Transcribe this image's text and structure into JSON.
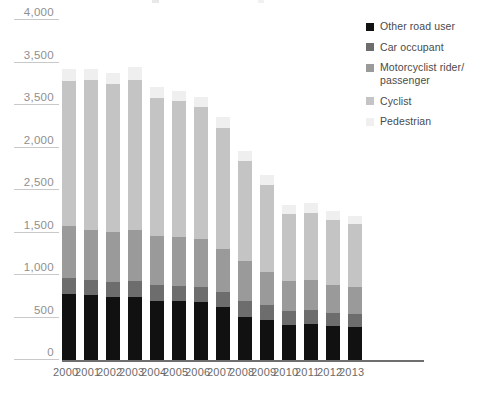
{
  "chart_data": {
    "type": "bar",
    "title": "",
    "xlabel": "",
    "ylabel": "",
    "stacked": true,
    "grid": true,
    "legend_position": "right",
    "ylim": [
      0,
      4000
    ],
    "categories": [
      "2000",
      "2001",
      "2002",
      "2003",
      "2004",
      "2005",
      "2006",
      "2007",
      "2008",
      "2009",
      "2010",
      "2011",
      "2012",
      "2013"
    ],
    "y_axis_ticks": [
      "4,000",
      "3,500",
      "3,500",
      "2,000",
      "2,500",
      "1,500",
      "1,000",
      "500",
      "0"
    ],
    "series": [
      {
        "name": "Other road user",
        "color": "#111111",
        "values": [
          780,
          760,
          740,
          745,
          700,
          690,
          680,
          620,
          510,
          470,
          415,
          425,
          400,
          390
        ]
      },
      {
        "name": "Car occupant",
        "color": "#6d6d6d",
        "values": [
          180,
          185,
          180,
          185,
          180,
          175,
          175,
          175,
          190,
          175,
          160,
          160,
          155,
          150
        ]
      },
      {
        "name": "Motorcyclist rider/ passenger",
        "color": "#9a9a9a",
        "values": [
          620,
          590,
          590,
          600,
          580,
          580,
          565,
          510,
          460,
          390,
          355,
          355,
          330,
          320
        ]
      },
      {
        "name": "Cyclist",
        "color": "#c4c4c4",
        "values": [
          1700,
          1760,
          1740,
          1760,
          1620,
          1600,
          1560,
          1430,
          1180,
          1030,
          790,
          790,
          760,
          740
        ]
      },
      {
        "name": "Pedestrian",
        "color": "#efefef",
        "values": [
          140,
          130,
          130,
          160,
          130,
          125,
          120,
          125,
          120,
          115,
          105,
          115,
          105,
          100
        ]
      }
    ]
  },
  "legend": {
    "items": [
      {
        "label": "Other road user",
        "color": "#111111"
      },
      {
        "label": "Car occupant",
        "color": "#6d6d6d"
      },
      {
        "label": "Motorcyclist rider/ passenger",
        "color": "#9a9a9a"
      },
      {
        "label": "Cyclist",
        "color": "#c4c4c4"
      },
      {
        "label": "Pedestrian",
        "color": "#efefef"
      }
    ]
  }
}
